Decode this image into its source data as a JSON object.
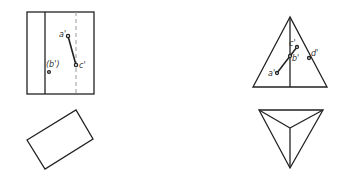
{
  "diagram": {
    "type": "orthographic-projection",
    "colors": {
      "line": "#222222",
      "dashed": "#999999",
      "background": "#ffffff"
    },
    "views": {
      "prism_front": {
        "labels": {
          "a": "a'",
          "b": "(b')",
          "c": "c'"
        }
      },
      "prism_top": {},
      "pyramid_front": {
        "labels": {
          "a": "a'",
          "b": "b'",
          "c": "c'",
          "d": "d'"
        }
      },
      "pyramid_top": {}
    }
  }
}
